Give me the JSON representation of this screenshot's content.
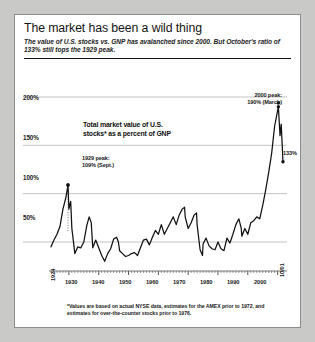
{
  "figure": {
    "title": "The market has been a wild thing",
    "subtitle": "The value of U.S. stocks vs. GNP has avalanched since 2000. But October's ratio of 133% still tops the 1929 peak.",
    "footnote": "*Values are based on actual NYSE data, estimates for the AMEX prior to 1972, and estimates for over-the-counter stocks prior to 1976.",
    "background_color": "#ffffff",
    "page_color": "#c9c9c7",
    "line_color": "#111111",
    "grid_color": "#b4b4b4"
  },
  "annotations": {
    "peak_1929_line1": "1929 peak:",
    "peak_1929_line2": "109% (Sept.)",
    "peak_2000_line1": "2000 peak:",
    "peak_2000_line2": "190% (March)",
    "current_value": "133%",
    "marker_icon": "dot-marker-icon"
  },
  "chart_data": {
    "type": "line",
    "title": "Total market value of U.S. stocks* as a percent of GNP",
    "title_line1": "Total market value of U.S.",
    "title_line2": "stocks* as a percent of GNP",
    "xlabel": "",
    "ylabel": "",
    "xlim": [
      1924,
      2001.8
    ],
    "ylim": [
      20,
      200
    ],
    "grid": true,
    "legend": "none",
    "ytick_labels": [
      "200%",
      "150%",
      "100%",
      "50%"
    ],
    "ytick_values": [
      200,
      150,
      100,
      50
    ],
    "xtick_labels": [
      "1924",
      "1930",
      "1940",
      "1950",
      "1960",
      "1970",
      "1980",
      "1990",
      "2000",
      "10/01"
    ],
    "xtick_values": [
      1924,
      1930,
      1940,
      1950,
      1960,
      1970,
      1980,
      1990,
      2000,
      2001.8
    ],
    "series": [
      {
        "name": "Total market value of U.S. stocks as a percent of GNP",
        "x": [
          1924,
          1925,
          1926,
          1927,
          1928,
          1929.0,
          1929.7,
          1930,
          1930.6,
          1931,
          1932,
          1933,
          1934,
          1935,
          1936,
          1936.8,
          1937.5,
          1938,
          1939,
          1940,
          1941,
          1942,
          1943,
          1944,
          1945,
          1946,
          1946.6,
          1947,
          1948,
          1949,
          1950,
          1951,
          1952,
          1953,
          1954,
          1955,
          1956,
          1957,
          1958,
          1959,
          1960,
          1961,
          1962,
          1963,
          1964,
          1965,
          1966,
          1967,
          1968,
          1968.8,
          1969,
          1970,
          1971,
          1972,
          1972.8,
          1973,
          1974,
          1974.8,
          1975,
          1976,
          1977,
          1978,
          1979,
          1980,
          1981,
          1982,
          1983,
          1984,
          1985,
          1986,
          1987,
          1987.8,
          1988,
          1989,
          1990,
          1991,
          1992,
          1993,
          1994,
          1995,
          1996,
          1997,
          1998,
          1999,
          2000.25,
          2000.8,
          2001.2,
          2001.8
        ],
        "y": [
          45,
          52,
          58,
          66,
          84,
          96,
          109,
          84,
          92,
          64,
          38,
          45,
          44,
          50,
          67,
          76,
          70,
          44,
          52,
          44,
          36,
          30,
          38,
          43,
          53,
          55,
          50,
          41,
          38,
          35,
          36,
          38,
          39,
          36,
          44,
          52,
          53,
          47,
          55,
          62,
          58,
          68,
          58,
          64,
          70,
          76,
          68,
          78,
          84,
          86,
          76,
          64,
          70,
          78,
          80,
          68,
          42,
          36,
          48,
          54,
          46,
          43,
          42,
          50,
          43,
          41,
          54,
          49,
          58,
          68,
          74,
          64,
          56,
          64,
          58,
          70,
          72,
          76,
          74,
          88,
          104,
          122,
          142,
          170,
          190,
          160,
          172,
          133
        ]
      }
    ],
    "highlight_points": [
      {
        "label": "1929 peak",
        "x": 1929.7,
        "y": 109,
        "note": "109% (Sept.)"
      },
      {
        "label": "2000 peak",
        "x": 2000.25,
        "y": 190,
        "note": "190% (March)"
      },
      {
        "label": "current",
        "x": 2001.8,
        "y": 133,
        "note": "133%"
      }
    ]
  }
}
